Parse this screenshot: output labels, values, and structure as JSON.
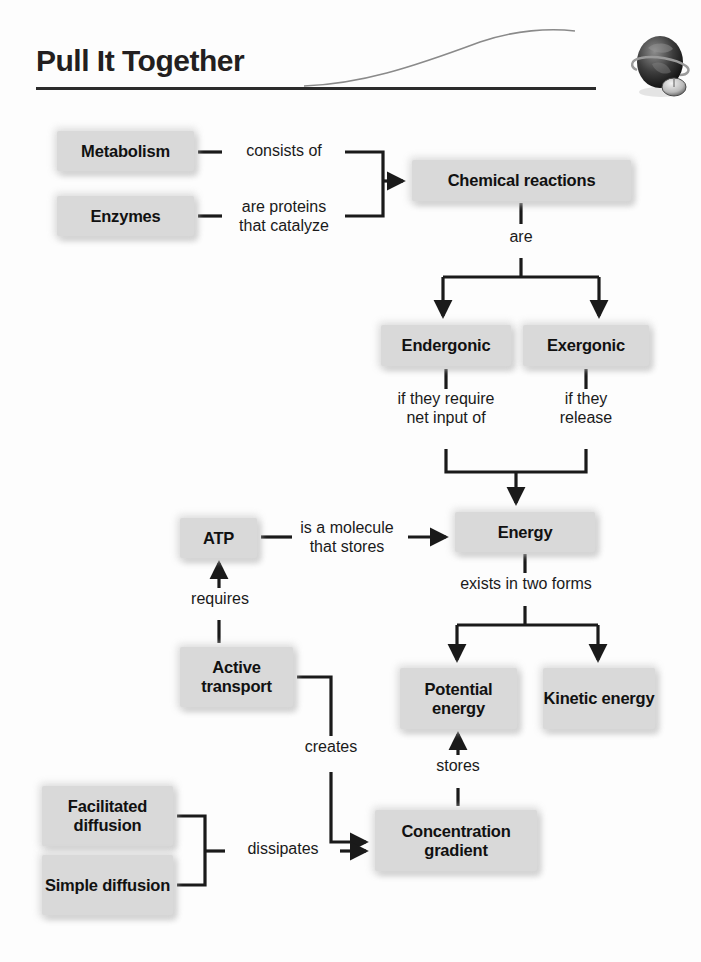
{
  "header": {
    "title": "Pull It Together",
    "icon": "globe-with-mouse-icon",
    "rule_color": "#2b2b2b"
  },
  "theme": {
    "node_fill": "#d9d9d9",
    "text_color": "#111111",
    "line_color": "#1a1a1a",
    "page_background": "#fdfdfd"
  },
  "diagram": {
    "type": "concept-map",
    "nodes": [
      {
        "id": "metabolism",
        "label": "Metabolism",
        "x": 57,
        "y": 131,
        "w": 137,
        "h": 40
      },
      {
        "id": "enzymes",
        "label": "Enzymes",
        "x": 57,
        "y": 196,
        "w": 137,
        "h": 40
      },
      {
        "id": "chemical",
        "label": "Chemical reactions",
        "x": 412,
        "y": 160,
        "w": 219,
        "h": 41
      },
      {
        "id": "endergonic",
        "label": "Endergonic",
        "x": 381,
        "y": 325,
        "w": 130,
        "h": 41
      },
      {
        "id": "exergonic",
        "label": "Exergonic",
        "x": 523,
        "y": 325,
        "w": 126,
        "h": 41
      },
      {
        "id": "atp",
        "label": "ATP",
        "x": 180,
        "y": 518,
        "w": 77,
        "h": 40
      },
      {
        "id": "energy",
        "label": "Energy",
        "x": 455,
        "y": 512,
        "w": 140,
        "h": 40
      },
      {
        "id": "active",
        "label": "Active\ntransport",
        "x": 180,
        "y": 647,
        "w": 113,
        "h": 60
      },
      {
        "id": "potential",
        "label": "Potential\nenergy",
        "x": 400,
        "y": 668,
        "w": 117,
        "h": 61
      },
      {
        "id": "kinetic",
        "label": "Kinetic\nenergy",
        "x": 543,
        "y": 668,
        "w": 112,
        "h": 61
      },
      {
        "id": "facilitated",
        "label": "Facilitated\ndiffusion",
        "x": 42,
        "y": 786,
        "w": 131,
        "h": 60
      },
      {
        "id": "simple",
        "label": "Simple\ndiffusion",
        "x": 42,
        "y": 855,
        "w": 131,
        "h": 60
      },
      {
        "id": "concentration",
        "label": "Concentration\ngradient",
        "x": 375,
        "y": 810,
        "w": 162,
        "h": 61
      }
    ],
    "edges": [
      {
        "id": "metabolism-chemical",
        "from": "metabolism",
        "to": "chemical",
        "label": "consists of"
      },
      {
        "id": "enzymes-chemical",
        "from": "enzymes",
        "to": "chemical",
        "label": "are proteins\nthat catalyze"
      },
      {
        "id": "chemical-split",
        "from": "chemical",
        "to": "endergonic, exergonic",
        "label": "are"
      },
      {
        "id": "endergonic-energy",
        "from": "endergonic",
        "to": "energy",
        "label": "if they require\nnet input of"
      },
      {
        "id": "exergonic-energy",
        "from": "exergonic",
        "to": "energy",
        "label": "if they\nrelease"
      },
      {
        "id": "atp-energy",
        "from": "atp",
        "to": "energy",
        "label": "is a molecule\nthat stores"
      },
      {
        "id": "active-atp",
        "from": "active",
        "to": "atp",
        "label": "requires"
      },
      {
        "id": "energy-forms",
        "from": "energy",
        "to": "potential, kinetic",
        "label": "exists in two forms"
      },
      {
        "id": "active-concentration",
        "from": "active",
        "to": "concentration",
        "label": "creates"
      },
      {
        "id": "diffusion-concentration",
        "from": "facilitated, simple",
        "to": "concentration",
        "label": "dissipates"
      },
      {
        "id": "concentration-potential",
        "from": "concentration",
        "to": "potential",
        "label": "stores"
      }
    ]
  }
}
